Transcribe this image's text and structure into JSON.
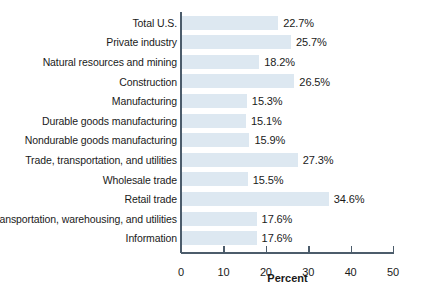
{
  "chart_data": {
    "type": "bar",
    "orientation": "horizontal",
    "title": "",
    "subtitle": "",
    "xlabel": "Percent",
    "ylabel": "",
    "xlim": [
      0,
      50
    ],
    "xticks": [
      0,
      10,
      20,
      30,
      40,
      50
    ],
    "xtick_labels": [
      "0",
      "10",
      "20",
      "30",
      "40",
      "50"
    ],
    "grid": false,
    "legend": false,
    "bar_color": "#dde8f1",
    "axis_color": "#4c5c6b",
    "text_color": "#1a1a1a",
    "categories": [
      "Total U.S.",
      "Private industry",
      "Natural resources and mining",
      "Construction",
      "Manufacturing",
      "Durable goods manufacturing",
      "Nondurable goods manufacturing",
      "Trade, transportation, and utilities",
      "Wholesale trade",
      "Retail trade",
      "Transportation, warehousing, and utilities",
      "Information"
    ],
    "values": [
      22.7,
      25.7,
      18.2,
      26.5,
      15.3,
      15.1,
      15.9,
      27.3,
      15.5,
      34.6,
      17.6,
      17.6
    ],
    "value_labels": [
      "22.7%",
      "25.7%",
      "18.2%",
      "26.5%",
      "15.3%",
      "15.1%",
      "15.9%",
      "27.3%",
      "15.5%",
      "34.6%",
      "17.6%",
      "17.6%"
    ]
  }
}
